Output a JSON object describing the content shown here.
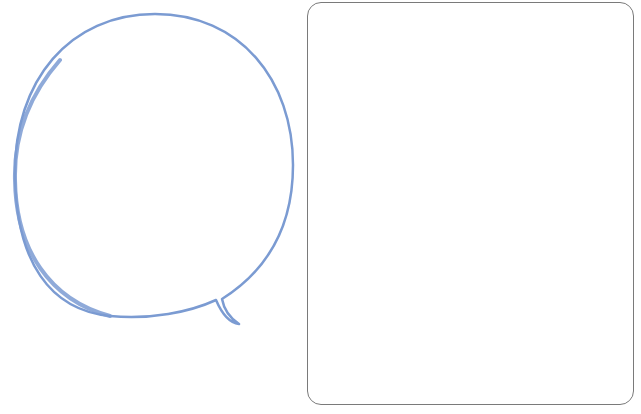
{
  "canvas": {
    "width": 641,
    "height": 414,
    "background": "#ffffff"
  },
  "speech_bubble": {
    "shape": "speech-bubble",
    "stroke_color": "#7b9bd2",
    "fill_color": "#ffffff",
    "tail_direction": "bottom-right",
    "text": ""
  },
  "frame": {
    "shape": "rounded-rectangle",
    "stroke_color": "#7a7a7a",
    "fill_color": "#ffffff",
    "text": ""
  }
}
